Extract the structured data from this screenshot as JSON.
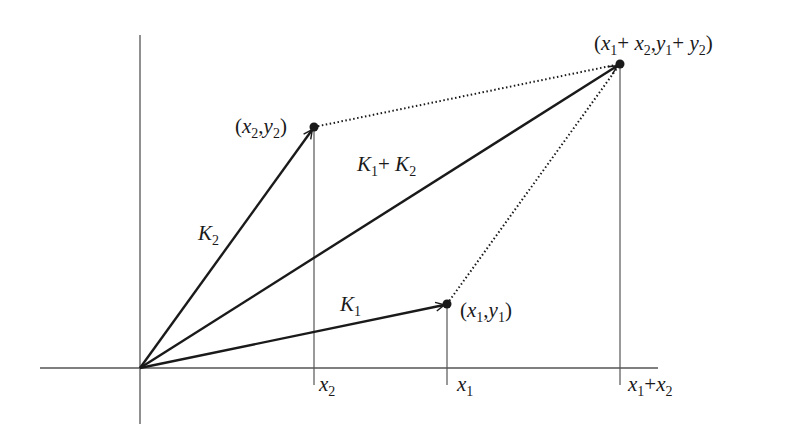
{
  "diagram": {
    "colors": {
      "ink": "#1a1a1a",
      "axis": "#555555",
      "background": "#ffffff"
    },
    "origin": {
      "x": 140,
      "y": 368
    },
    "axes": {
      "x_axis": {
        "x1": 40,
        "x2": 658,
        "y": 368
      },
      "y_axis": {
        "x": 140,
        "y1": 35,
        "y2": 424
      }
    },
    "points": [
      {
        "id": "p2",
        "label": "(x2,y2)",
        "x": 314,
        "y": 127
      },
      {
        "id": "p1",
        "label": "(x1,y1)",
        "x": 447,
        "y": 304
      },
      {
        "id": "psum",
        "label": "(x1+ x2,y1+ y2)",
        "x": 620,
        "y": 64
      }
    ],
    "vectors": [
      {
        "name": "K1",
        "from": "origin",
        "to": "p1",
        "style": "solid-arrow"
      },
      {
        "name": "K2",
        "from": "origin",
        "to": "p2",
        "style": "solid-arrow"
      },
      {
        "name": "K1+ K2",
        "from": "origin",
        "to": "psum",
        "style": "solid-arrow"
      }
    ],
    "dotted_lines": [
      {
        "from": "p2",
        "to": "psum"
      },
      {
        "from": "p1",
        "to": "psum"
      }
    ],
    "x_ticks": [
      {
        "label": "x2",
        "x": 314
      },
      {
        "label": "x1",
        "x": 447
      },
      {
        "label": "x1+x2",
        "x": 620
      }
    ],
    "labels": {
      "k1": {
        "base": "K",
        "sub": "1"
      },
      "k2": {
        "base": "K",
        "sub": "2"
      },
      "ksum": {
        "base1": "K",
        "sub1": "1",
        "plus": "+ ",
        "base2": "K",
        "sub2": "2"
      },
      "p2": {
        "open": "(",
        "x": "x",
        "xs": "2",
        "comma": ",",
        "y": "y",
        "ys": "2",
        "close": ")"
      },
      "p1": {
        "open": "(",
        "x": "x",
        "xs": "1",
        "comma": ",",
        "y": "y",
        "ys": "1",
        "close": ")"
      },
      "psum": {
        "open": "(",
        "x1": "x",
        "x1s": "1",
        "plus1": "+ ",
        "x2": "x",
        "x2s": "2",
        "comma": ",",
        "y1": "y",
        "y1s": "1",
        "plus2": "+ ",
        "y2": "y",
        "y2s": "2",
        "close": ")"
      },
      "tick_x2": {
        "base": "x",
        "sub": "2"
      },
      "tick_x1": {
        "base": "x",
        "sub": "1"
      },
      "tick_sum": {
        "b1": "x",
        "s1": "1",
        "plus": "+",
        "b2": "x",
        "s2": "2"
      }
    }
  }
}
